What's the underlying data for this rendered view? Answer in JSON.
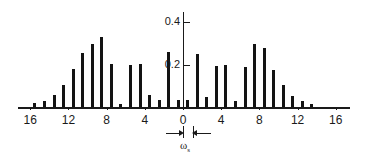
{
  "chart_data": {
    "type": "bar",
    "title": "",
    "subtitle": "",
    "xlabel": "",
    "ylabel": "",
    "grid": false,
    "legend": null,
    "xlim": [
      -17.5,
      17.5
    ],
    "ylim": [
      0,
      0.45
    ],
    "x_tick_labels": [
      "16",
      "12",
      "8",
      "4",
      "0",
      "4",
      "8",
      "12",
      "16"
    ],
    "x_tick_values": [
      -16,
      -12,
      -8,
      -4,
      0,
      4,
      8,
      12,
      16
    ],
    "y_tick_labels": [
      "0.2",
      "0.4"
    ],
    "y_tick_values": [
      0.2,
      0.4
    ],
    "annotation": {
      "label": "ω",
      "label_sub": "s",
      "kind": "double-arrow-span",
      "span_from": 0,
      "span_to": 1
    },
    "x": [
      -15.5,
      -14.5,
      -13.5,
      -12.5,
      -11.5,
      -10.5,
      -9.5,
      -8.5,
      -7.5,
      -6.5,
      -5.5,
      -4.5,
      -3.5,
      -2.5,
      -1.5,
      -0.5,
      0.5,
      1.5,
      2.5,
      3.5,
      4.5,
      5.5,
      6.5,
      7.5,
      8.5,
      9.5,
      10.5,
      11.5,
      12.5,
      13.5,
      14.5
    ],
    "values": [
      0.02,
      0.03,
      0.055,
      0.105,
      0.18,
      0.255,
      0.295,
      0.33,
      0.205,
      0.015,
      0.2,
      0.205,
      0.055,
      0.035,
      0.26,
      0.035,
      0.035,
      0.25,
      0.045,
      0.195,
      0.2,
      0.03,
      0.19,
      0.295,
      0.28,
      0.175,
      0.105,
      0.05,
      0.03,
      0.015,
      0.0
    ],
    "series": [
      {
        "name": "spectrum",
        "values": [
          0.02,
          0.03,
          0.055,
          0.105,
          0.18,
          0.255,
          0.295,
          0.33,
          0.205,
          0.015,
          0.2,
          0.205,
          0.055,
          0.035,
          0.26,
          0.035,
          0.035,
          0.25,
          0.045,
          0.195,
          0.2,
          0.03,
          0.19,
          0.295,
          0.28,
          0.175,
          0.105,
          0.05,
          0.03,
          0.015,
          0.0
        ]
      }
    ]
  },
  "style": {
    "ink": "#131313",
    "axis": "#1a1a1a",
    "background": "#ffffff"
  }
}
